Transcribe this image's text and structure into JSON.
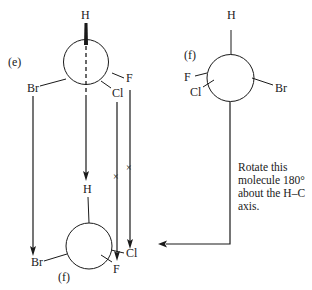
{
  "diagram": {
    "top_left": {
      "label": "(e)",
      "substituents": {
        "top": "H",
        "left": "Br",
        "right_upper": "F",
        "right_lower": "Cl"
      }
    },
    "top_right": {
      "label": "(f)",
      "substituents": {
        "top": "H",
        "left_upper": "F",
        "left_lower": "Cl",
        "right": "Br"
      }
    },
    "bottom": {
      "label": "(f)",
      "substituents": {
        "top": "H",
        "left": "Br",
        "right_lower": "F",
        "right": "Cl"
      }
    },
    "cross_mark": "×",
    "instruction": [
      "Rotate this",
      "molecule 180°",
      "about the H–C",
      "axis."
    ]
  },
  "colors": {
    "ink": "#1a1a1a",
    "background": "#ffffff"
  }
}
